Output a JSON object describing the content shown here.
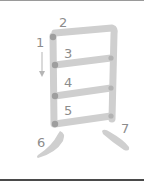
{
  "diagram": {
    "character": "貝",
    "type": "kanji-stroke-order",
    "stroke_count": 7,
    "stroke_color": "#cfcfcf",
    "stroke_start_color": "#9e9e9e",
    "label_color": "#8c8c8c",
    "labels": [
      "1",
      "2",
      "3",
      "4",
      "5",
      "6",
      "7"
    ],
    "direction_arrow": "arrow-down"
  }
}
